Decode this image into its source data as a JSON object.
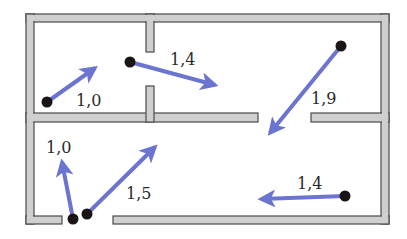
{
  "colors": {
    "wall_fill": "#cfcfcf",
    "wall_stroke": "#4a4a4a",
    "arrow": "#6b74d1",
    "dot": "#1a1414",
    "background": "#ffffff",
    "label": "#2a2a2a"
  },
  "rooms": [
    {
      "name": "top-left-room"
    },
    {
      "name": "top-right-room"
    },
    {
      "name": "bottom-room"
    }
  ],
  "vectors": [
    {
      "id": "v1",
      "label": "1,0",
      "start": [
        47,
        102
      ],
      "end": [
        95,
        68
      ],
      "label_pos": [
        76,
        106
      ]
    },
    {
      "id": "v2",
      "label": "1,4",
      "start": [
        130,
        62
      ],
      "end": [
        215,
        85
      ],
      "label_pos": [
        170,
        65
      ]
    },
    {
      "id": "v3",
      "label": "1,9",
      "start": [
        341,
        46
      ],
      "end": [
        270,
        133
      ],
      "label_pos": [
        311,
        104
      ]
    },
    {
      "id": "v4",
      "label": "1,0",
      "start": [
        73,
        219
      ],
      "end": [
        62,
        162
      ],
      "label_pos": [
        46,
        153
      ]
    },
    {
      "id": "v5",
      "label": "1,5",
      "start": [
        87,
        214
      ],
      "end": [
        155,
        147
      ],
      "label_pos": [
        126,
        199
      ]
    },
    {
      "id": "v6",
      "label": "1,4",
      "start": [
        345,
        196
      ],
      "end": [
        261,
        199
      ],
      "label_pos": [
        297,
        189
      ]
    }
  ]
}
